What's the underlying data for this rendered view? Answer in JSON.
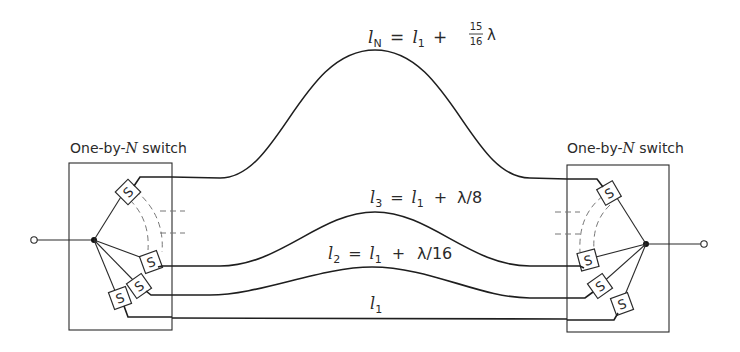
{
  "diagram": {
    "left_switch": {
      "label": "One-by-N switch",
      "prefix": "One-by-",
      "n": "N",
      "suffix": " switch",
      "switch_glyph": "S"
    },
    "right_switch": {
      "label": "One-by-N switch",
      "prefix": "One-by-",
      "n": "N",
      "suffix": " switch",
      "switch_glyph": "S"
    },
    "paths": [
      {
        "id": "lN",
        "label": "l_N = l_1 + 15/16 λ",
        "lhs": "l",
        "lhs_sub": "N",
        "rhs": "l",
        "rhs_sub": "1",
        "plus": "+",
        "frac_num": "15",
        "frac_den": "16",
        "tail": "λ"
      },
      {
        "id": "l3",
        "label": "l_3 = l_1 + λ/8",
        "lhs": "l",
        "lhs_sub": "3",
        "rhs": "l",
        "rhs_sub": "1",
        "plus": "+",
        "tail": "λ/8"
      },
      {
        "id": "l2",
        "label": "l_2 = l_1 + λ/16",
        "lhs": "l",
        "lhs_sub": "2",
        "rhs": "l",
        "rhs_sub": "1",
        "plus": "+",
        "tail": "λ/16"
      },
      {
        "id": "l1",
        "label": "l_1",
        "lhs": "l",
        "lhs_sub": "1"
      }
    ],
    "eq": "="
  }
}
